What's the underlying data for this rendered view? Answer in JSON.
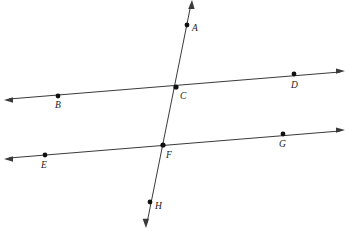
{
  "figure": {
    "type": "geometry-diagram",
    "background_color": "#ffffff",
    "line_color": "#3a3a3a",
    "point_color": "#111111",
    "label_color": "#1a1a1a"
  },
  "labels": {
    "A": "A",
    "B": "B",
    "C": "C",
    "D": "D",
    "E": "E",
    "F": "F",
    "G": "G",
    "H": "H"
  },
  "points": [
    {
      "id": "A",
      "label": "A",
      "x": 187,
      "y": 25,
      "label_x": 192,
      "label_y": 31
    },
    {
      "id": "B",
      "label": "B",
      "x": 58,
      "y": 96,
      "label_x": 55,
      "label_y": 108
    },
    {
      "id": "C",
      "label": "C",
      "x": 176,
      "y": 87,
      "label_x": 180,
      "label_y": 99
    },
    {
      "id": "D",
      "label": "D",
      "x": 294,
      "y": 74,
      "label_x": 291,
      "label_y": 88
    },
    {
      "id": "E",
      "label": "E",
      "x": 45,
      "y": 155,
      "label_x": 41,
      "label_y": 168
    },
    {
      "id": "F",
      "label": "F",
      "x": 163,
      "y": 145,
      "label_x": 166,
      "label_y": 158
    },
    {
      "id": "G",
      "label": "G",
      "x": 283,
      "y": 134,
      "label_x": 279,
      "label_y": 147
    },
    {
      "id": "H",
      "label": "H",
      "x": 150,
      "y": 202,
      "label_x": 155,
      "label_y": 209
    }
  ],
  "lines": [
    {
      "id": "line-BD",
      "name": "upper-parallel-line",
      "through": [
        "B",
        "C",
        "D"
      ],
      "x1": 9,
      "y1": 99,
      "x2": 340,
      "y2": 72,
      "arrow_start": true,
      "arrow_end": true
    },
    {
      "id": "line-EG",
      "name": "lower-parallel-line",
      "through": [
        "E",
        "F",
        "G"
      ],
      "x1": 9,
      "y1": 158,
      "x2": 340,
      "y2": 131,
      "arrow_start": true,
      "arrow_end": true
    },
    {
      "id": "line-AH",
      "name": "transversal-line",
      "through": [
        "A",
        "C",
        "F",
        "H"
      ],
      "x1": 191,
      "y1": 4,
      "x2": 147,
      "y2": 223,
      "arrow_start": true,
      "arrow_end": true
    }
  ]
}
